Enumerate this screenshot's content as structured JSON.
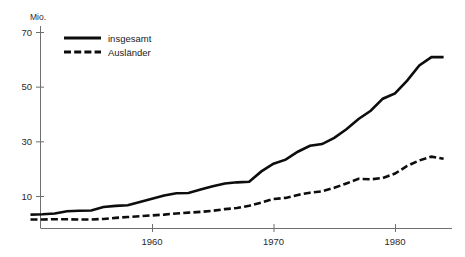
{
  "chart_data": {
    "type": "line",
    "title": "",
    "subtitle": "",
    "xlabel": "",
    "ylabel": "Mio.",
    "unit_label": "Mio.",
    "grid": false,
    "legend_position": "top-left",
    "xlim": [
      1950,
      1984
    ],
    "ylim": [
      0,
      76
    ],
    "y_ticks": [
      10,
      30,
      50,
      70
    ],
    "y_tick_labels": [
      "10",
      "30",
      "50",
      "70"
    ],
    "x_ticks": [
      1960,
      1970,
      1980
    ],
    "x_tick_labels": [
      "1960",
      "1970",
      "1980"
    ],
    "x": [
      1950,
      1951,
      1952,
      1953,
      1954,
      1955,
      1956,
      1957,
      1958,
      1959,
      1960,
      1961,
      1962,
      1963,
      1964,
      1965,
      1966,
      1967,
      1968,
      1969,
      1970,
      1971,
      1972,
      1973,
      1974,
      1975,
      1976,
      1977,
      1978,
      1979,
      1980,
      1981,
      1982,
      1983,
      1984
    ],
    "series": [
      {
        "name": "insgesamt",
        "style": "solid",
        "color": "#0d0d0d",
        "values": [
          3.2,
          3.3,
          3.6,
          4.4,
          4.6,
          4.7,
          6.0,
          6.4,
          6.6,
          7.8,
          9.0,
          10.2,
          11.0,
          11.1,
          12.4,
          13.6,
          14.6,
          15.0,
          15.2,
          19.0,
          21.8,
          23.3,
          26.2,
          28.4,
          29.0,
          31.3,
          34.4,
          38.2,
          41.2,
          45.6,
          47.5,
          52.2,
          57.8,
          60.8,
          60.8
        ]
      },
      {
        "name": "Ausländer",
        "style": "dashed",
        "color": "#0d0d0d",
        "values": [
          1.4,
          1.4,
          1.5,
          1.5,
          1.4,
          1.4,
          1.6,
          2.0,
          2.3,
          2.6,
          2.9,
          3.2,
          3.6,
          3.9,
          4.2,
          4.6,
          5.2,
          5.6,
          6.4,
          7.6,
          8.9,
          9.3,
          10.4,
          11.2,
          11.7,
          13.0,
          14.6,
          16.3,
          16.1,
          16.6,
          18.2,
          21.0,
          23.0,
          24.4,
          23.6
        ]
      }
    ],
    "legend": [
      {
        "label": "insgesamt",
        "style": "solid"
      },
      {
        "label": "Ausländer",
        "style": "dashed"
      }
    ]
  }
}
